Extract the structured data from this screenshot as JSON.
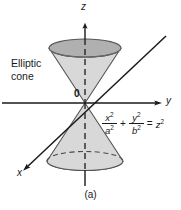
{
  "figure": {
    "caption": "(a)",
    "surface_label": "Elliptic\ncone",
    "origin_label": "0",
    "axes": {
      "z": "z",
      "y": "y",
      "x": "x"
    },
    "equation": {
      "term1": {
        "numerator": "x",
        "numerator_exp": "2",
        "denominator": "a",
        "denominator_exp": "2"
      },
      "operator": "+",
      "term2": {
        "numerator": "y",
        "numerator_exp": "2",
        "denominator": "b",
        "denominator_exp": "2"
      },
      "equals": "=",
      "rhs": "z",
      "rhs_exp": "2",
      "plain": "x^2/a^2 + y^2/b^2 = z^2"
    },
    "colors": {
      "background": "#ffffff",
      "ink": "#1a1a1a",
      "cone_body": "#d8d8d8",
      "cone_cap": "#b0b0b0",
      "cone_outline": "#555555",
      "axis": "#1a1a1a"
    },
    "geometry": {
      "origin": {
        "x": 85,
        "y": 103
      },
      "z_axis_top": {
        "x": 85,
        "y": 24
      },
      "z_axis_bottom": {
        "x": 85,
        "y": 186
      },
      "y_axis_right": {
        "x": 162,
        "y": 103
      },
      "y_axis_left": {
        "x": 2,
        "y": 103
      },
      "x_axis_near": {
        "x": 22,
        "y": 172
      },
      "x_axis_far": {
        "x": 166,
        "y": 36
      },
      "top_ellipse": {
        "cx": 85,
        "cy": 48,
        "rx": 36,
        "ry": 9
      },
      "bottom_ellipse": {
        "cx": 85,
        "cy": 161,
        "rx": 38,
        "ry": 9.5
      }
    }
  }
}
